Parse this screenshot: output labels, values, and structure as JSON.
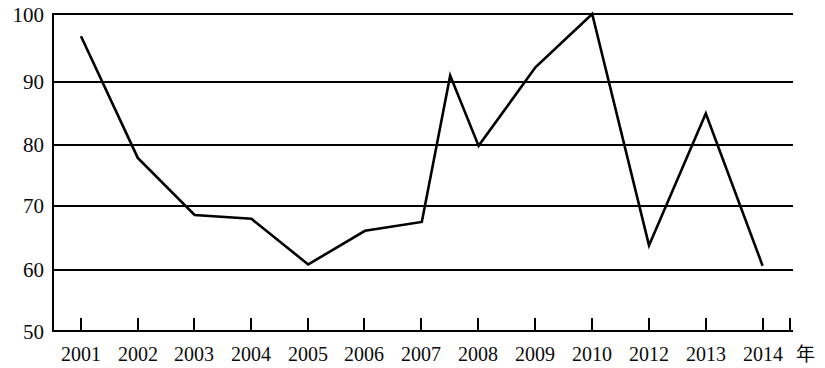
{
  "chart_data": {
    "type": "line",
    "title": "",
    "subtitle": "",
    "xlabel": "年",
    "ylabel": "",
    "categories": [
      "2001",
      "2002",
      "2003",
      "2004",
      "2005",
      "2006",
      "2007",
      "2008",
      "2009",
      "2010",
      "2012",
      "2013",
      "2014"
    ],
    "x_tick_labels": [
      "2001",
      "2002",
      "2003",
      "2004",
      "2005",
      "2006",
      "2007",
      "2008",
      "2009",
      "2010",
      "2012",
      "2013",
      "2014"
    ],
    "y_tick_labels": [
      "50",
      "60",
      "70",
      "80",
      "90",
      "100"
    ],
    "y_ticks": [
      50,
      60,
      70,
      80,
      90,
      100
    ],
    "ylim": [
      50,
      100
    ],
    "grid": "horizontal",
    "legend": "none",
    "line_color": "#000000",
    "grid_color": "#000000",
    "axis_color": "#000000",
    "background": "#ffffff",
    "series": [
      {
        "name": "series-1",
        "values": [
          96.5,
          77.3,
          68.3,
          67.7,
          60.5,
          65.8,
          67.2,
          79.2,
          91.6,
          100.0,
          63.5,
          84.3,
          60.3
        ]
      }
    ],
    "vertices": [
      {
        "x_label": "2001",
        "value": 96.5
      },
      {
        "x_label": "2002",
        "value": 77.3
      },
      {
        "x_label": "2003",
        "value": 68.3
      },
      {
        "x_label": "2004",
        "value": 67.7
      },
      {
        "x_label": "2005",
        "value": 60.5
      },
      {
        "x_label": "2006",
        "value": 65.8
      },
      {
        "x_label": "2007",
        "value": 67.2
      },
      {
        "x_label": "2007.5",
        "value": 90.3
      },
      {
        "x_label": "2008",
        "value": 79.2
      },
      {
        "x_label": "2009",
        "value": 91.6
      },
      {
        "x_label": "2010",
        "value": 100.0
      },
      {
        "x_label": "2012",
        "value": 63.5
      },
      {
        "x_label": "2013",
        "value": 84.3
      },
      {
        "x_label": "2014",
        "value": 60.3
      }
    ]
  },
  "axes": {
    "y_labels": [
      "100",
      "90",
      "80",
      "70",
      "60",
      "50"
    ],
    "x_labels": [
      "2001",
      "2002",
      "2003",
      "2004",
      "2005",
      "2006",
      "2007",
      "2008",
      "2009",
      "2010",
      "2012",
      "2013",
      "2014"
    ],
    "unit_label": "年"
  }
}
